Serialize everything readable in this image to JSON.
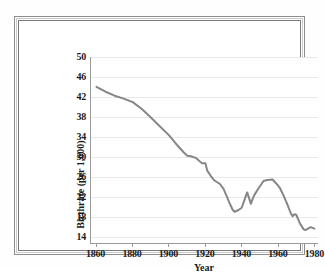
{
  "figure": {
    "frame_color": "#7a7a7a",
    "background": "#ffffff"
  },
  "chart_data": {
    "type": "line",
    "title": "",
    "xlabel": "Year",
    "ylabel": "Birthrate (per 1,000)",
    "xlim": [
      1857,
      1982
    ],
    "ylim": [
      12.5,
      50
    ],
    "grid": "horizontal",
    "legend": "none",
    "line_color": "#868686",
    "line_width": 2,
    "xticks": [
      1860,
      1880,
      1900,
      1920,
      1940,
      1960,
      1980
    ],
    "xtick_labels": [
      "1860",
      "1880",
      "1900",
      "1920",
      "1940",
      "1960",
      "1980"
    ],
    "yticks": [
      14,
      18,
      22,
      26,
      30,
      34,
      38,
      42,
      46,
      50
    ],
    "ytick_labels": [
      "14",
      "18",
      "22",
      "26",
      "30",
      "34",
      "38",
      "42",
      "46",
      "50"
    ],
    "series": [
      {
        "name": "Birthrate",
        "x": [
          1860,
          1865,
          1870,
          1875,
          1880,
          1885,
          1890,
          1895,
          1900,
          1905,
          1908,
          1910,
          1912,
          1915,
          1918,
          1920,
          1921,
          1923,
          1925,
          1928,
          1930,
          1932,
          1933,
          1935,
          1936,
          1938,
          1940,
          1942,
          1943,
          1944,
          1945,
          1946,
          1947,
          1949,
          1952,
          1954,
          1957,
          1959,
          1961,
          1963,
          1965,
          1967,
          1968,
          1969,
          1970,
          1972,
          1974,
          1975,
          1976,
          1978,
          1980
        ],
        "values": [
          44.0,
          43.0,
          42.2,
          41.6,
          40.9,
          39.5,
          37.8,
          36.0,
          34.2,
          32.0,
          30.8,
          30.1,
          30.0,
          29.6,
          28.6,
          28.6,
          27.1,
          26.0,
          25.1,
          24.4,
          23.4,
          21.7,
          20.8,
          19.2,
          18.8,
          19.1,
          19.6,
          21.7,
          22.7,
          21.6,
          20.4,
          21.4,
          22.2,
          23.4,
          25.0,
          25.2,
          25.3,
          24.5,
          23.6,
          22.1,
          20.4,
          18.5,
          17.9,
          18.3,
          18.2,
          16.5,
          15.3,
          15.1,
          15.3,
          15.7,
          15.4
        ]
      }
    ]
  }
}
